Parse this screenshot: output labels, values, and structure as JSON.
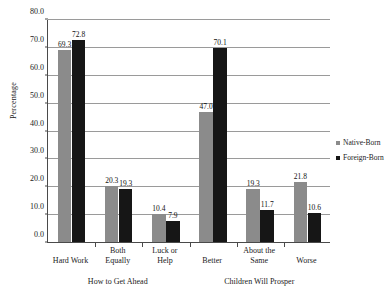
{
  "chart_data": {
    "type": "bar",
    "title": "",
    "xlabel": "",
    "ylabel": "Percentage",
    "ylim": [
      0,
      80
    ],
    "ytick_step": 10,
    "ytick_labels": [
      "0.0",
      "10.0",
      "20.0",
      "30.0",
      "40.0",
      "50.0",
      "60.0",
      "70.0",
      "80.0"
    ],
    "grid": true,
    "legend_position": "right",
    "categories": [
      "Hard Work",
      "Both\nEqually",
      "Luck or\nHelp",
      "Better",
      "About the\nSame",
      "Worse"
    ],
    "group_labels": [
      {
        "label": "How to Get Ahead",
        "categories": [
          "Hard Work",
          "Both Equally",
          "Luck or Help"
        ]
      },
      {
        "label": "Children Will Prosper",
        "categories": [
          "Better",
          "About the Same",
          "Worse"
        ]
      }
    ],
    "series": [
      {
        "name": "Native-Born",
        "color": "#8b8b8b",
        "values": [
          69.3,
          20.3,
          10.4,
          47.0,
          19.3,
          21.8
        ],
        "value_labels": [
          "69.3",
          "20.3",
          "10.4",
          "47.0",
          "19.3",
          "21.8"
        ]
      },
      {
        "name": "Foreign-Born",
        "color": "#161616",
        "values": [
          72.8,
          19.3,
          7.9,
          70.1,
          11.7,
          10.6
        ],
        "value_labels": [
          "72.8",
          "19.3",
          "7.9",
          "70.1",
          "11.7",
          "10.6"
        ]
      }
    ]
  },
  "legend": {
    "items": [
      {
        "label": "Native-Born",
        "color": "#8b8b8b"
      },
      {
        "label": "Foreign-Born",
        "color": "#161616"
      }
    ]
  }
}
